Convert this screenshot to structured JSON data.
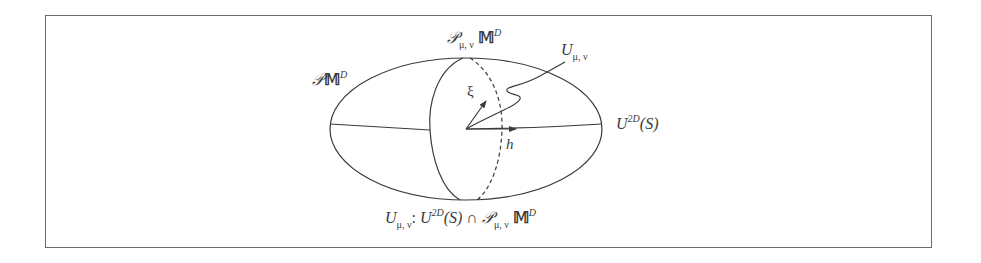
{
  "figure": {
    "type": "geometric-diagram",
    "stroke_color": "#3a3a3a",
    "frame_color": "#6a6a6a"
  },
  "labels": {
    "top_meridian": {
      "script": "𝒫",
      "subscript": "μ, ν",
      "base": "𝕄",
      "superscript": "D"
    },
    "left_surface": {
      "script": "𝒫",
      "base": "𝕄",
      "superscript": "D"
    },
    "curve": {
      "base": "U",
      "subscript": "μ, ν"
    },
    "right_plane": {
      "base": "U",
      "superscript": "2D",
      "arg": "(S)"
    },
    "vector_xi": "ξ",
    "vector_h": "h",
    "caption": {
      "lhs_base": "U",
      "lhs_subscript": "μ, ν",
      "colon": ":",
      "u_base": "U",
      "u_superscript": "2D",
      "u_arg": "(S)",
      "cap": "∩",
      "p_script": "𝒫",
      "p_subscript": "μ, ν",
      "m_base": "𝕄",
      "m_superscript": "D"
    }
  }
}
